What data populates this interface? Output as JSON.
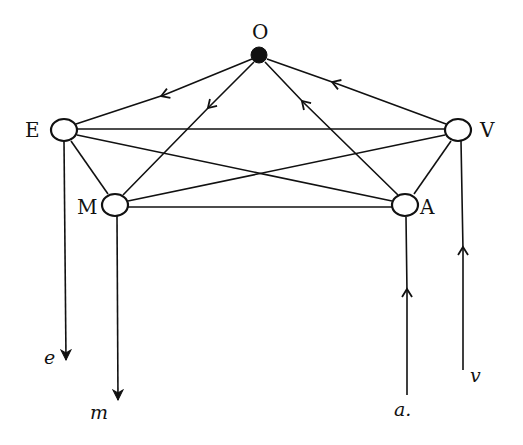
{
  "diagram": {
    "type": "directed-graph",
    "stroke_color": "#111111",
    "background": "#ffffff",
    "nodes": [
      {
        "id": "O",
        "label": "O",
        "x": 259,
        "y": 55,
        "filled": true
      },
      {
        "id": "E",
        "label": "E",
        "x": 64,
        "y": 130,
        "filled": false
      },
      {
        "id": "V",
        "label": "V",
        "x": 458,
        "y": 130,
        "filled": false
      },
      {
        "id": "M",
        "label": "M",
        "x": 115,
        "y": 205,
        "filled": false
      },
      {
        "id": "A",
        "label": "A",
        "x": 405,
        "y": 205,
        "filled": false
      }
    ],
    "edges": [
      {
        "from": "O",
        "to": "E",
        "directed": true
      },
      {
        "from": "O",
        "to": "M",
        "directed": true
      },
      {
        "from": "A",
        "to": "O",
        "directed": true
      },
      {
        "from": "V",
        "to": "O",
        "directed": true
      },
      {
        "from": "E",
        "to": "V",
        "directed": false
      },
      {
        "from": "E",
        "to": "M",
        "directed": false
      },
      {
        "from": "E",
        "to": "A",
        "directed": false
      },
      {
        "from": "M",
        "to": "V",
        "directed": false
      },
      {
        "from": "M",
        "to": "A",
        "directed": false
      },
      {
        "from": "V",
        "to": "A",
        "directed": false
      }
    ],
    "terminals": [
      {
        "id": "e",
        "label": "e",
        "node": "E",
        "direction": "out"
      },
      {
        "id": "m",
        "label": "m",
        "node": "M",
        "direction": "out"
      },
      {
        "id": "a",
        "label": "a.",
        "node": "A",
        "direction": "in"
      },
      {
        "id": "v",
        "label": "v",
        "node": "V",
        "direction": "in"
      }
    ]
  },
  "labels": {
    "O": "O",
    "E": "E",
    "V": "V",
    "M": "M",
    "A": "A",
    "e": "e",
    "m": "m",
    "a": "a.",
    "v": "v"
  }
}
